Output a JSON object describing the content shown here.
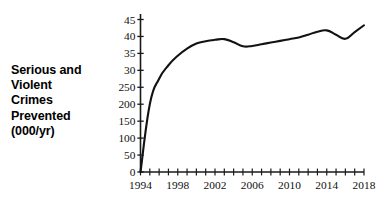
{
  "figure": {
    "axis_caption_lines": [
      "Serious and",
      "Violent",
      "Crimes",
      "Prevented",
      "(000/yr)"
    ],
    "line_color": "#121212",
    "axis_color": "#1a1a1a",
    "background_color": "#ffffff"
  },
  "chart_data": {
    "type": "line",
    "title": "",
    "xlabel": "",
    "ylabel": "Serious and Violent Crimes Prevented (000/yr)",
    "grid": false,
    "legend": false,
    "xlim": [
      1994,
      2018
    ],
    "ylim": [
      0,
      45
    ],
    "x_tick_labels": [
      "1994",
      "1998",
      "2002",
      "2006",
      "2010",
      "2014",
      "2018"
    ],
    "x_tick_values": [
      1994,
      1998,
      2002,
      2006,
      2010,
      2014,
      2018
    ],
    "x_minor_tick_step": 1,
    "y_tick_labels": [
      "45",
      "40",
      "35",
      "30",
      "250",
      "200",
      "150",
      "100",
      "50",
      "0"
    ],
    "y_tick_values": [
      45,
      40,
      35,
      30,
      25,
      20,
      15,
      10,
      5,
      0
    ],
    "series": [
      {
        "name": "Serious and Violent Crimes Prevented",
        "x": [
          1994,
          1995,
          1996,
          1997,
          1998,
          1999,
          2000,
          2001,
          2002,
          2003,
          2004,
          2005,
          2006,
          2007,
          2008,
          2009,
          2010,
          2011,
          2012,
          2013,
          2014,
          2015,
          2016,
          2017,
          2018
        ],
        "values": [
          0.0,
          20.0,
          27.5,
          31.5,
          34.3,
          36.4,
          37.9,
          38.6,
          39.0,
          39.2,
          38.3,
          37.1,
          37.2,
          37.7,
          38.2,
          38.7,
          39.2,
          39.7,
          40.5,
          41.4,
          41.8,
          40.5,
          39.3,
          41.3,
          43.3
        ]
      }
    ]
  }
}
